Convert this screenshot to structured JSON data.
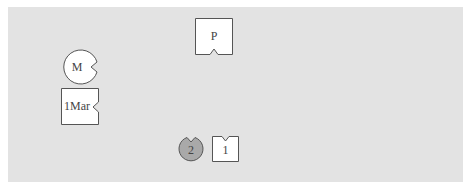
{
  "diagram": {
    "background_color": "#e3e3e3",
    "pieces": [
      {
        "id": "p",
        "label": "P",
        "shape": "square",
        "notch": "bottom",
        "fill": "#ffffff"
      },
      {
        "id": "m",
        "label": "M",
        "shape": "circle",
        "notch": "right",
        "fill": "#ffffff"
      },
      {
        "id": "1mar",
        "label": "1Mar",
        "shape": "square",
        "notch": "right",
        "fill": "#ffffff"
      },
      {
        "id": "2",
        "label": "2",
        "shape": "circle",
        "notch": "top",
        "fill": "#a9a9a9"
      },
      {
        "id": "1",
        "label": "1",
        "shape": "square",
        "notch": "top",
        "fill": "#ffffff"
      }
    ]
  }
}
